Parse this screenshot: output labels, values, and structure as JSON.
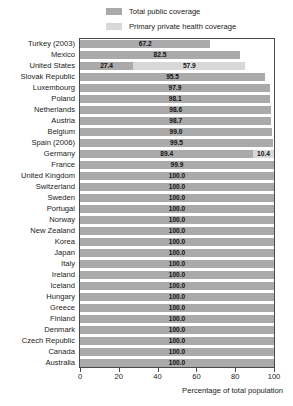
{
  "chart_data": {
    "type": "bar",
    "orientation": "horizontal",
    "stacked": true,
    "title": "",
    "xlabel": "Percentage of total population",
    "ylabel": "",
    "xlim": [
      0,
      100
    ],
    "xticks": [
      0,
      20,
      40,
      60,
      80,
      100
    ],
    "xtick_labels": [
      "0",
      "20",
      "40",
      "60",
      "80",
      "100"
    ],
    "grid": false,
    "legend_position": "top",
    "legend": [
      {
        "name": "Total public coverage",
        "color": "#aaaaaa"
      },
      {
        "name": "Primary private health coverage",
        "color": "#d8d8d8"
      }
    ],
    "categories": [
      "Turkey (2003)",
      "Mexico",
      "United States",
      "Slovak Republic",
      "Luxembourg",
      "Poland",
      "Netherlands",
      "Austria",
      "Belgium",
      "Spain (2006)",
      "Germany",
      "France",
      "United Kingdom",
      "Switzerland",
      "Sweden",
      "Portugal",
      "Norway",
      "New Zealand",
      "Korea",
      "Japan",
      "Italy",
      "Ireland",
      "Iceland",
      "Hungary",
      "Greece",
      "Finland",
      "Denmark",
      "Czech Republic",
      "Canada",
      "Australia"
    ],
    "series": [
      {
        "name": "Total public coverage",
        "color": "#aaaaaa",
        "values": [
          67.2,
          82.5,
          27.4,
          95.5,
          97.9,
          98.1,
          98.6,
          98.7,
          99.0,
          99.5,
          89.4,
          99.9,
          100.0,
          100.0,
          100.0,
          100.0,
          100.0,
          100.0,
          100.0,
          100.0,
          100.0,
          100.0,
          100.0,
          100.0,
          100.0,
          100.0,
          100.0,
          100.0,
          100.0,
          100.0
        ]
      },
      {
        "name": "Primary private health coverage",
        "color": "#d8d8d8",
        "values": [
          0,
          0,
          57.9,
          0,
          0,
          0,
          0,
          0,
          0,
          0,
          10.4,
          0,
          0,
          0,
          0,
          0,
          0,
          0,
          0,
          0,
          0,
          0,
          0,
          0,
          0,
          0,
          0,
          0,
          0,
          0
        ]
      }
    ],
    "data_labels": [
      {
        "category": "Turkey (2003)",
        "public": "67.2",
        "private": null
      },
      {
        "category": "Mexico",
        "public": "82.5",
        "private": null
      },
      {
        "category": "United States",
        "public": "27.4",
        "private": "57.9"
      },
      {
        "category": "Slovak Republic",
        "public": "95.5",
        "private": null
      },
      {
        "category": "Luxembourg",
        "public": "97.9",
        "private": null
      },
      {
        "category": "Poland",
        "public": "98.1",
        "private": null
      },
      {
        "category": "Netherlands",
        "public": "98.6",
        "private": null
      },
      {
        "category": "Austria",
        "public": "98.7",
        "private": null
      },
      {
        "category": "Belgium",
        "public": "99.0",
        "private": null
      },
      {
        "category": "Spain (2006)",
        "public": "99.5",
        "private": null
      },
      {
        "category": "Germany",
        "public": "89.4",
        "private": "10.4"
      },
      {
        "category": "France",
        "public": "99.9",
        "private": null
      },
      {
        "category": "United Kingdom",
        "public": "100.0",
        "private": null
      },
      {
        "category": "Switzerland",
        "public": "100.0",
        "private": null
      },
      {
        "category": "Sweden",
        "public": "100.0",
        "private": null
      },
      {
        "category": "Portugal",
        "public": "100.0",
        "private": null
      },
      {
        "category": "Norway",
        "public": "100.0",
        "private": null
      },
      {
        "category": "New Zealand",
        "public": "100.0",
        "private": null
      },
      {
        "category": "Korea",
        "public": "100.0",
        "private": null
      },
      {
        "category": "Japan",
        "public": "100.0",
        "private": null
      },
      {
        "category": "Italy",
        "public": "100.0",
        "private": null
      },
      {
        "category": "Ireland",
        "public": "100.0",
        "private": null
      },
      {
        "category": "Iceland",
        "public": "100.0",
        "private": null
      },
      {
        "category": "Hungary",
        "public": "100.0",
        "private": null
      },
      {
        "category": "Greece",
        "public": "100.0",
        "private": null
      },
      {
        "category": "Finland",
        "public": "100.0",
        "private": null
      },
      {
        "category": "Denmark",
        "public": "100.0",
        "private": null
      },
      {
        "category": "Czech Republic",
        "public": "100.0",
        "private": null
      },
      {
        "category": "Canada",
        "public": "100.0",
        "private": null
      },
      {
        "category": "Australia",
        "public": "100.0",
        "private": null
      }
    ]
  }
}
